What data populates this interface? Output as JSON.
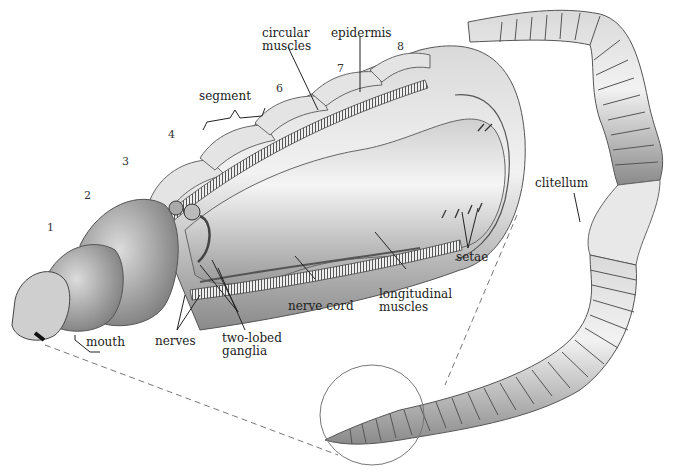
{
  "figure": {
    "colors": {
      "ink": "#222222",
      "worm_light": "#e6e6e6",
      "worm_mid": "#b5b5b5",
      "worm_dark": "#6e6e6e",
      "background": "#ffffff"
    }
  },
  "segment_numbers": [
    "1",
    "2",
    "3",
    "4",
    "6",
    "7",
    "8"
  ],
  "labels": {
    "circular_muscles_line1": "circular",
    "circular_muscles_line2": "muscles",
    "epidermis": "epidermis",
    "segment": "segment",
    "clitellum": "clitellum",
    "setae": "setae",
    "longitudinal_muscles_line1": "longitudinal",
    "longitudinal_muscles_line2": "muscles",
    "nerve_cord": "nerve cord",
    "two_lobed_ganglia_line1": "two-lobed",
    "two_lobed_ganglia_line2": "ganglia",
    "nerves": "nerves",
    "mouth": "mouth"
  }
}
